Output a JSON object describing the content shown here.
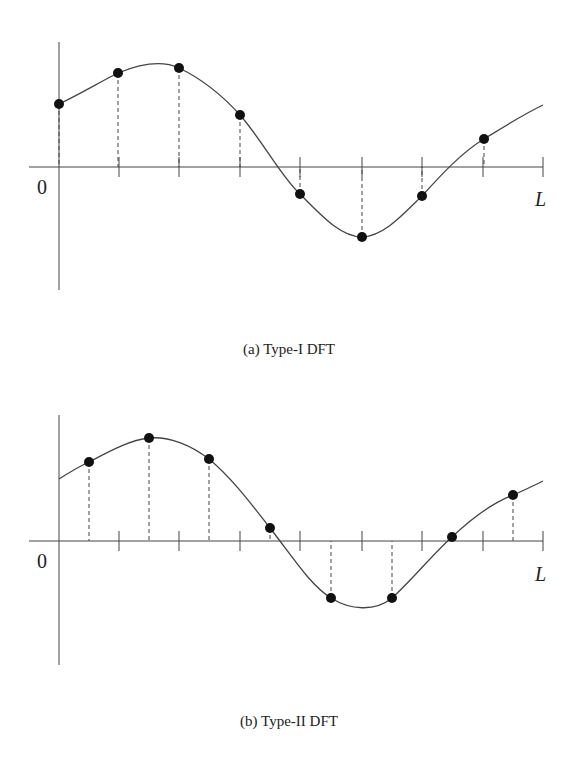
{
  "figure_a": {
    "caption": "(a) Type-I DFT",
    "origin_label": "0",
    "end_label": "L",
    "axis": {
      "x0": 59,
      "x1": 543,
      "y": 167,
      "ytop": 42,
      "ybottom": 290
    },
    "ticks": [
      119,
      179,
      240,
      300,
      362,
      422,
      483,
      543
    ],
    "curve": "M59,104 C80,94 100,82 118,73 C140,64 162,60 179,68 C200,78 222,95 240,115 C262,140 282,178 300,194 C320,214 340,237 362,237 C385,236 405,212 422,196 C440,176 462,152 484,139 C505,126 524,114 543,105",
    "points": [
      [
        59,
        104
      ],
      [
        118,
        73
      ],
      [
        179,
        68
      ],
      [
        240,
        115
      ],
      [
        300,
        194
      ],
      [
        362,
        237
      ],
      [
        422,
        196
      ],
      [
        484,
        139
      ]
    ]
  },
  "figure_b": {
    "caption": "(b) Type-II DFT",
    "origin_label": "0",
    "end_label": "L",
    "axis": {
      "x0": 59,
      "x1": 543,
      "y": 541,
      "ytop": 415,
      "ybottom": 665
    },
    "ticks": [
      119,
      179,
      240,
      300,
      362,
      422,
      483,
      543
    ],
    "curve": "M59,479 C70,472 80,466 89,462 C110,451 130,440 149,438 C170,436 192,446 209,459 C232,478 252,505 270,528 C292,556 310,585 331,598 C350,610 375,612 392,598 C412,580 432,555 452,537 C470,520 492,503 513,495 C525,490 535,485 543,481",
    "points": [
      [
        89,
        462
      ],
      [
        149,
        438
      ],
      [
        209,
        459
      ],
      [
        270,
        528
      ],
      [
        331,
        598
      ],
      [
        392,
        598
      ],
      [
        452,
        537
      ],
      [
        513,
        495
      ]
    ]
  },
  "chart_data": [
    {
      "type": "line",
      "title": "(a) Type-I DFT",
      "xlabel": "",
      "ylabel": "",
      "x_range_labels": [
        "0",
        "L"
      ],
      "sample_positions": [
        "0",
        "L/8",
        "2L/8",
        "3L/8",
        "4L/8",
        "5L/8",
        "6L/8",
        "7L/8"
      ],
      "sample_values_approx": [
        0.5,
        0.75,
        0.79,
        0.42,
        -0.22,
        -0.56,
        -0.23,
        0.22
      ]
    },
    {
      "type": "line",
      "title": "(b) Type-II DFT",
      "xlabel": "",
      "ylabel": "",
      "x_range_labels": [
        "0",
        "L"
      ],
      "sample_positions": [
        "L/16",
        "3L/16",
        "5L/16",
        "7L/16",
        "9L/16",
        "11L/16",
        "13L/16",
        "15L/16"
      ],
      "sample_values_approx": [
        0.63,
        0.82,
        0.65,
        0.1,
        -0.45,
        -0.45,
        0.03,
        0.37
      ]
    }
  ]
}
